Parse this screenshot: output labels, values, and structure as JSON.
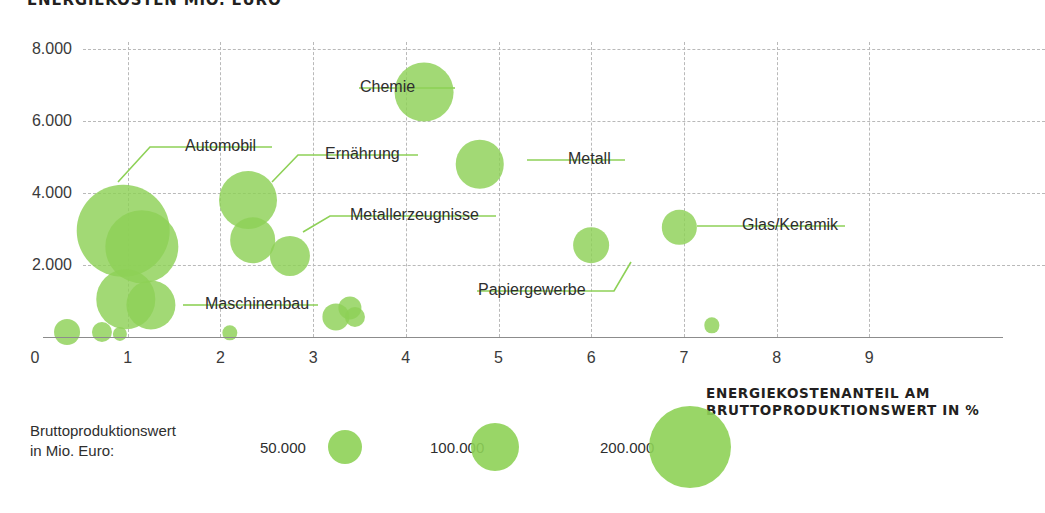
{
  "chart_title": "ENERGIEKOSTEN MIO. EURO",
  "axis_caption_line1": "ENERGIEKOSTENANTEIL AM",
  "axis_caption_line2": "BRUTTOPRODUKTIONSWERT IN %",
  "legend": {
    "title_line1": "Bruttoproduktionswert",
    "title_line2": "in Mio. Euro:",
    "items": [
      {
        "label": "50.000",
        "radius_px": 17
      },
      {
        "label": "100.000",
        "radius_px": 24
      },
      {
        "label": "200.000",
        "radius_px": 41
      }
    ]
  },
  "colors": {
    "bubble": "#8ed157",
    "grid": "#b9b9b9",
    "axis": "#8c8c8c",
    "text": "#2e2e2e",
    "leader": "#8ed157"
  },
  "chart_data": {
    "type": "scatter",
    "title": "ENERGIEKOSTEN MIO. EURO",
    "xlabel": "ENERGIEKOSTENANTEIL AM BRUTTOPRODUKTIONSWERT IN %",
    "ylabel": "ENERGIEKOSTEN MIO. EURO",
    "xlim": [
      0,
      10
    ],
    "ylim": [
      0,
      8600
    ],
    "xticks": [
      0,
      1,
      2,
      3,
      4,
      5,
      6,
      7,
      8,
      9
    ],
    "xticklabels": [
      "0",
      "1",
      "2",
      "3",
      "4",
      "5",
      "6",
      "7",
      "8",
      "9"
    ],
    "yticks": [
      2000,
      4000,
      6000,
      8000
    ],
    "yticklabels": [
      "2.000",
      "4.000",
      "6.000",
      "8.000"
    ],
    "grid": true,
    "legend_position": "bottom-left",
    "size_legend": {
      "label": "Bruttoproduktionswert in Mio. Euro:",
      "breakpoints": [
        50000,
        100000,
        200000
      ]
    },
    "size_encoding": "area proportional to Bruttoproduktionswert (Mio. Euro)",
    "points": [
      {
        "name": "Automobil",
        "x": 0.95,
        "y": 2950,
        "size": 255000,
        "labeled": true
      },
      {
        "name": "Maschinenbau",
        "x": 0.98,
        "y": 1050,
        "size": 105000,
        "labeled": true
      },
      {
        "name": "Chemie",
        "x": 4.2,
        "y": 6800,
        "size": 103000,
        "labeled": true
      },
      {
        "name": "Ernaehrung",
        "x": 2.3,
        "y": 3800,
        "size": 100000,
        "labeled": true
      },
      {
        "name": "Metall",
        "x": 4.8,
        "y": 4800,
        "size": 70000,
        "labeled": true
      },
      {
        "name": "Metallerzeugnisse",
        "x": 2.75,
        "y": 2250,
        "size": 48000,
        "labeled": true
      },
      {
        "name": "Papiergewerbe",
        "x": 6.0,
        "y": 2550,
        "size": 38000,
        "labeled": true
      },
      {
        "name": "Glas/Keramik",
        "x": 6.95,
        "y": 3050,
        "size": 35000,
        "labeled": true
      },
      {
        "name": "unlabeled-1",
        "x": 1.15,
        "y": 2500,
        "size": 160000,
        "labeled": false
      },
      {
        "name": "unlabeled-2",
        "x": 2.35,
        "y": 2700,
        "size": 62000,
        "labeled": false
      },
      {
        "name": "unlabeled-3",
        "x": 1.25,
        "y": 900,
        "size": 72000,
        "labeled": false
      },
      {
        "name": "unlabeled-4",
        "x": 3.25,
        "y": 550,
        "size": 22000,
        "labeled": false
      },
      {
        "name": "unlabeled-5",
        "x": 3.4,
        "y": 800,
        "size": 16000,
        "labeled": false
      },
      {
        "name": "unlabeled-6",
        "x": 3.45,
        "y": 560,
        "size": 12000,
        "labeled": false
      },
      {
        "name": "unlabeled-7",
        "x": 0.35,
        "y": 140,
        "size": 20000,
        "labeled": false
      },
      {
        "name": "unlabeled-8",
        "x": 0.72,
        "y": 130,
        "size": 12000,
        "labeled": false
      },
      {
        "name": "unlabeled-9",
        "x": 0.92,
        "y": 90,
        "size": 6000,
        "labeled": false
      },
      {
        "name": "unlabeled-10",
        "x": 2.1,
        "y": 110,
        "size": 7000,
        "labeled": false
      },
      {
        "name": "unlabeled-11",
        "x": 7.3,
        "y": 320,
        "size": 7000,
        "labeled": false
      }
    ],
    "callouts": [
      {
        "label": "Chemie",
        "text_x": 360,
        "text_y": 78,
        "underline_from": 359,
        "underline_to": 430,
        "underline_y": 88,
        "elbow": [
          [
            430,
            88
          ],
          [
            455,
            88
          ]
        ]
      },
      {
        "label": "Automobil",
        "text_x": 185,
        "text_y": 137,
        "underline_from": 184,
        "underline_to": 272,
        "underline_y": 147,
        "elbow": [
          [
            184,
            147
          ],
          [
            150,
            147
          ],
          [
            118,
            182
          ]
        ]
      },
      {
        "label": "Ernaehrung",
        "text_x": 325,
        "text_y": 145,
        "underline_from": 324,
        "underline_to": 418,
        "underline_y": 155,
        "elbow": [
          [
            324,
            155
          ],
          [
            298,
            155
          ],
          [
            272,
            182
          ]
        ]
      },
      {
        "label": "Metall",
        "text_x": 568,
        "text_y": 150,
        "underline_from": 567,
        "underline_to": 625,
        "underline_y": 160,
        "elbow": [
          [
            567,
            160
          ],
          [
            527,
            160
          ]
        ]
      },
      {
        "label": "Metallerzeugnisse",
        "text_x": 350,
        "text_y": 206,
        "underline_from": 349,
        "underline_to": 496,
        "underline_y": 216,
        "elbow": [
          [
            349,
            216
          ],
          [
            330,
            216
          ],
          [
            303,
            232
          ]
        ]
      },
      {
        "label": "Glas/Keramik",
        "text_x": 742,
        "text_y": 216,
        "underline_from": 741,
        "underline_to": 845,
        "underline_y": 226,
        "elbow": [
          [
            741,
            226
          ],
          [
            697,
            226
          ]
        ]
      },
      {
        "label": "Papiergewerbe",
        "text_x": 478,
        "text_y": 281,
        "underline_from": 477,
        "underline_to": 594,
        "underline_y": 291,
        "elbow": [
          [
            594,
            291
          ],
          [
            614,
            291
          ],
          [
            631,
            262
          ]
        ]
      },
      {
        "label": "Maschinenbau",
        "text_x": 205,
        "text_y": 295,
        "underline_from": 204,
        "underline_to": 318,
        "underline_y": 305,
        "elbow": [
          [
            204,
            305
          ],
          [
            183,
            305
          ]
        ]
      }
    ]
  }
}
